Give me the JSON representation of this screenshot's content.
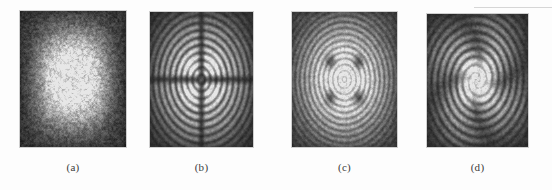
{
  "figure": {
    "background_color": "#fdfdfd",
    "caption_color": "#3b3b3b",
    "artifact": {
      "name": "scanner-line",
      "color": "#cfcfcf",
      "x": 474,
      "y": 7,
      "width": 78,
      "height": 1
    }
  },
  "panels": [
    {
      "id": "a",
      "label": "(a)",
      "caption_label": "(a)",
      "pattern": "speckle-blob",
      "description": "Bright speckled rounded-square spot, no fringes",
      "x": 20,
      "y": 11,
      "width": 106,
      "height": 136,
      "caption_x": 20,
      "caption_y": 161,
      "caption_width": 106,
      "bg_color": "#2e2e2e",
      "spot_color": "#b4b4b4",
      "rings": 0,
      "lobes": 0,
      "speckle": 0.38,
      "rotation": 0
    },
    {
      "id": "b",
      "label": "(b)",
      "caption_label": "(b)",
      "pattern": "concentric-rings-cross",
      "description": "Concentric interference rings with dark cross and four central bright lobes",
      "x": 150,
      "y": 12,
      "width": 103,
      "height": 135,
      "caption_x": 150,
      "caption_y": 161,
      "caption_width": 103,
      "bg_color": "#232323",
      "spot_color": "#c8c8c8",
      "rings": 9,
      "lobes": 4,
      "speckle": 0.18,
      "rotation": 0
    },
    {
      "id": "c",
      "label": "(c)",
      "caption_label": "(c)",
      "pattern": "concentric-rings-dark-spots",
      "description": "Concentric fringes over a broad blob with four dark vortex cores",
      "x": 292,
      "y": 12,
      "width": 105,
      "height": 135,
      "caption_x": 292,
      "caption_y": 161,
      "caption_width": 105,
      "bg_color": "#3b3b3b",
      "spot_color": "#a9a9a9",
      "rings": 11,
      "lobes": 4,
      "speckle": 0.22,
      "rotation": 0
    },
    {
      "id": "d",
      "label": "(d)",
      "caption_label": "(d)",
      "pattern": "spiral-pinwheel",
      "description": "Rotating pinwheel of spiral fringes with bright central quadrilateral",
      "x": 427,
      "y": 14,
      "width": 101,
      "height": 133,
      "caption_x": 427,
      "caption_y": 161,
      "caption_width": 101,
      "bg_color": "#2a2a2a",
      "spot_color": "#c0c0c0",
      "rings": 8,
      "lobes": 4,
      "speckle": 0.2,
      "rotation": 25
    }
  ]
}
